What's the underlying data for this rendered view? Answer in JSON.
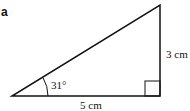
{
  "part_label": "a",
  "triangle": {
    "angle_label": "31°",
    "base_label": "5 cm",
    "height_label": "3 cm",
    "right_angle": true,
    "stroke_color": "#111111"
  }
}
